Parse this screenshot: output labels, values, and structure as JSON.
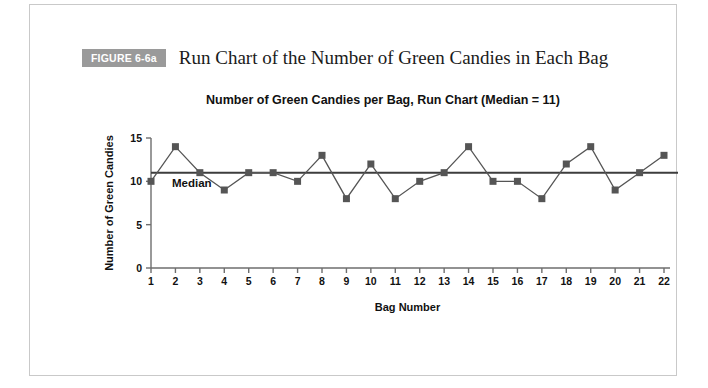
{
  "figure": {
    "badge_label": "FIGURE 6-6a",
    "caption": "Run Chart of the Number of Green Candies in Each Bag",
    "badge_color": "#9a9a9a"
  },
  "chart_data": {
    "type": "line",
    "title": "Number of Green Candies per Bag, Run Chart (Median = 11)",
    "xlabel": "Bag Number",
    "ylabel": "Number of Green Candies",
    "x": [
      1,
      2,
      3,
      4,
      5,
      6,
      7,
      8,
      9,
      10,
      11,
      12,
      13,
      14,
      15,
      16,
      17,
      18,
      19,
      20,
      21,
      22
    ],
    "values": [
      10,
      14,
      11,
      9,
      11,
      11,
      10,
      13,
      8,
      12,
      8,
      10,
      11,
      14,
      10,
      10,
      8,
      12,
      14,
      9,
      11,
      13
    ],
    "xtick_labels": [
      "1",
      "2",
      "3",
      "4",
      "5",
      "6",
      "7",
      "8",
      "9",
      "10",
      "11",
      "12",
      "13",
      "14",
      "15",
      "16",
      "17",
      "18",
      "19",
      "20",
      "21",
      "22"
    ],
    "ytick_labels": [
      "0",
      "5",
      "10",
      "15"
    ],
    "yticks": [
      0,
      5,
      10,
      15
    ],
    "ylim": [
      0,
      15
    ],
    "xlim": [
      1,
      22
    ],
    "grid": false,
    "legend": false,
    "series_color": "#555555",
    "marker": "square",
    "marker_color": "#555555",
    "annotations": [
      {
        "label": "Median",
        "value": 11,
        "line_color": "#3d3d3d"
      }
    ],
    "median_label": "Median",
    "median_value": 11
  }
}
